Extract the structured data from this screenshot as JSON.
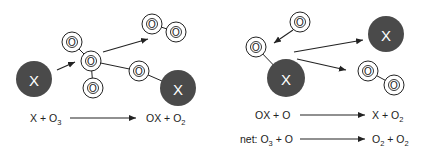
{
  "diagram": {
    "colors": {
      "catalyst": "#4a4a4a",
      "oxygen_outline": "#222222",
      "background": "#ffffff"
    },
    "left_panel": {
      "catalyst_label": "X",
      "oxygen_label": "O",
      "equation": {
        "reactants": "X + O",
        "reactants_sub": "3",
        "products": "OX + O",
        "products_sub": "2"
      }
    },
    "right_panel": {
      "catalyst_label": "X",
      "oxygen_label": "O",
      "equation_1": {
        "reactants": "OX + O",
        "products": "X + O",
        "products_sub": "2"
      },
      "equation_net": {
        "prefix": "net: ",
        "reactant_a": "O",
        "reactant_a_sub": "3",
        "reactant_rest": " + O",
        "product_a": "O",
        "product_a_sub": "2",
        "product_mid": " + O",
        "product_b_sub": "2"
      }
    }
  }
}
